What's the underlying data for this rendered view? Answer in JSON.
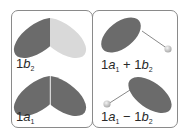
{
  "colors": {
    "dark_lobe": "#6b6b6b",
    "light_lobe": "#d9d9d9",
    "border": "#8a8a8a",
    "text": "#2a2a2a",
    "sphere": "#c8c8c8",
    "bond_line": "#7a7a7a"
  },
  "panels": [
    {
      "id": "left",
      "orbitals": [
        {
          "name": "1b2",
          "label": {
            "coef": "1",
            "letter": "b",
            "sub": "2"
          },
          "description": "two lobes, left dark, right light (opposite phase)"
        },
        {
          "name": "1a1",
          "label": {
            "coef": "1",
            "letter": "a",
            "sub": "1"
          },
          "description": "two dark lobes, same phase"
        }
      ]
    },
    {
      "id": "right",
      "orbitals": [
        {
          "name": "1a1+1b2",
          "label": {
            "coef1": "1",
            "letter1": "a",
            "sub1": "1",
            "op": "+",
            "coef2": "1",
            "letter2": "b",
            "sub2": "2"
          },
          "description": "single dark lobe upper-left with bond to sphere lower-right"
        },
        {
          "name": "1a1-1b2",
          "label": {
            "coef1": "1",
            "letter1": "a",
            "sub1": "1",
            "op": "−",
            "coef2": "1",
            "letter2": "b",
            "sub2": "2"
          },
          "description": "single dark lobe lower-right with bond to sphere lower-left"
        }
      ]
    }
  ]
}
